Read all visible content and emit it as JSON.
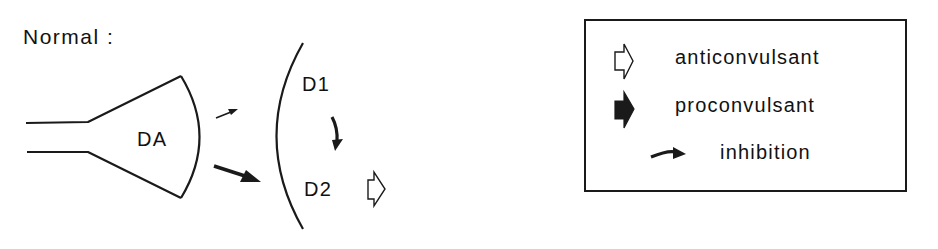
{
  "title": "Normal :",
  "diagram": {
    "presynaptic_label": "DA",
    "receptors": [
      {
        "label": "D1"
      },
      {
        "label": "D2"
      }
    ],
    "arrows": [
      {
        "from": "DA",
        "to": "D1",
        "weight": "thin"
      },
      {
        "from": "DA",
        "to": "D2",
        "weight": "thick"
      },
      {
        "from": "D1",
        "to": "D2",
        "type": "inhibition"
      },
      {
        "at": "D2",
        "type": "anticonvulsant"
      }
    ]
  },
  "legend": {
    "items": [
      {
        "icon": "open-arrow-icon",
        "label": "anticonvulsant"
      },
      {
        "icon": "filled-arrow-icon",
        "label": "proconvulsant"
      },
      {
        "icon": "curved-arrow-icon",
        "label": "inhibition"
      }
    ]
  },
  "colors": {
    "ink": "#1a1a1a",
    "background": "#ffffff"
  }
}
